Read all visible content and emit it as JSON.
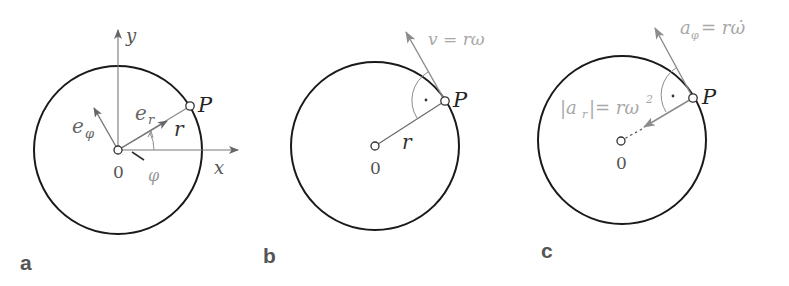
{
  "figure": {
    "colors": {
      "ink": "#1a1a1a",
      "accent_grey": "#8c8c8c",
      "label_grey": "#555555",
      "background": "#ffffff"
    },
    "panels": [
      {
        "id": "a",
        "panel_label": "a",
        "origin_label": "0",
        "point_label": "P",
        "x_axis_label": "x",
        "y_axis_label": "y",
        "radial_unit_label": "e",
        "radial_unit_sub": "r",
        "tangential_unit_label": "e",
        "tangential_unit_sub": "φ",
        "radius_label": "r",
        "angle_label": "φ"
      },
      {
        "id": "b",
        "panel_label": "b",
        "origin_label": "0",
        "point_label": "P",
        "radius_label": "r",
        "velocity_label": "v = rω",
        "right_angle_marker": "·"
      },
      {
        "id": "c",
        "panel_label": "c",
        "origin_label": "0",
        "point_label": "P",
        "tangential_accel_lhs": "a",
        "tangential_accel_sub": "φ",
        "tangential_accel_rhs": "= rω̇",
        "radial_accel_lhs": "|a",
        "radial_accel_sub": "r",
        "radial_accel_rhs": "|= rω",
        "radial_accel_exp": "2",
        "right_angle_marker": "·"
      }
    ]
  }
}
